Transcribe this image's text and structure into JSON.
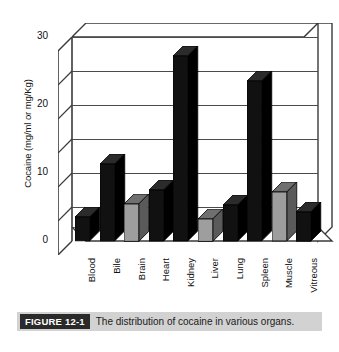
{
  "figure": {
    "badge": "FIGURE 12-1",
    "caption": "The distribution of cocaine in various organs."
  },
  "chart_data": {
    "type": "bar",
    "title": "",
    "subtitle": "",
    "xlabel": "",
    "ylabel": "Cocaine (mg/ml or mg/Kg)",
    "ylim": [
      0,
      30
    ],
    "ymajor_ticks": [
      0,
      10,
      20,
      30
    ],
    "yminor_ticks": [
      5,
      15,
      25
    ],
    "gridlines": [
      5,
      10,
      15,
      20,
      25,
      30
    ],
    "grid": true,
    "legend": "none",
    "style": "3d-column",
    "categories": [
      "Blood",
      "Bile",
      "Brain",
      "Heart",
      "Kidney",
      "Liver",
      "Lung",
      "Spleen",
      "Muscle",
      "Vitreous"
    ],
    "values": [
      3.5,
      11.3,
      5.5,
      7.5,
      27.2,
      3.3,
      5.3,
      23.5,
      7.2,
      4.3
    ],
    "series": [
      {
        "name": "Cocaine concentration",
        "values": [
          3.5,
          11.3,
          5.5,
          7.5,
          27.2,
          3.3,
          5.3,
          23.5,
          7.2,
          4.3
        ]
      }
    ],
    "bar_colors": [
      "#111111",
      "#111111",
      "#9e9e9e",
      "#111111",
      "#111111",
      "#9e9e9e",
      "#111111",
      "#111111",
      "#9e9e9e",
      "#111111"
    ],
    "colors": {
      "dark_bar": "#111111",
      "light_bar": "#9e9e9e",
      "axis": "#3a3a3a",
      "grid": "#4a4a4a",
      "plot_background": "#ffffff",
      "caption_background": "#d2d2d2",
      "badge_background": "#2a2a2a"
    }
  }
}
